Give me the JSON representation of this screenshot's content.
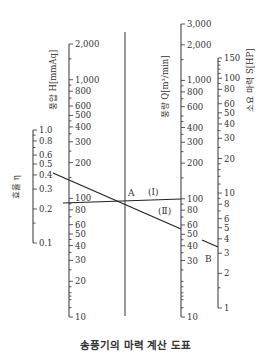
{
  "caption": "송풍기의 마력 계산 도표",
  "chart_data": {
    "type": "nomograph",
    "title": "송풍기의 마력 계산 도표",
    "axes": [
      {
        "id": "efficiency",
        "title": "효율 η",
        "scale": "log",
        "range": [
          0.1,
          1.0
        ],
        "tick_labels": [
          "1.0",
          "0.8",
          "0.6",
          "0.5",
          "0.4",
          "0.3",
          "0.2",
          "0.1"
        ]
      },
      {
        "id": "pressure",
        "title": "풍압 H[mmAq]",
        "scale": "log",
        "range": [
          10,
          2000
        ],
        "tick_labels": [
          "2,000",
          "1,000",
          "800",
          "600",
          "500",
          "400",
          "300",
          "200",
          "100",
          "80",
          "60",
          "50",
          "40",
          "30",
          "20",
          "10"
        ]
      },
      {
        "id": "pivot",
        "title": "",
        "scale": "none",
        "tick_labels": []
      },
      {
        "id": "airflow",
        "title": "풍량 Q[m³/min]",
        "scale": "log",
        "range": [
          10,
          3000
        ],
        "tick_labels": [
          "3,000",
          "2,000",
          "1,000",
          "800",
          "600",
          "400",
          "300",
          "200",
          "100",
          "80",
          "60",
          "50",
          "40",
          "30",
          "10"
        ]
      },
      {
        "id": "power",
        "title": "소요 마력 S[HP]",
        "scale": "log",
        "range": [
          1,
          150
        ],
        "tick_labels": [
          "150",
          "100",
          "80",
          "60",
          "50",
          "40",
          "30",
          "20",
          "10",
          "8",
          "6",
          "5",
          "4",
          "3",
          "2",
          "1"
        ]
      }
    ],
    "annotations": [
      {
        "label": "A",
        "description": "pivot point on reference line"
      },
      {
        "label": "(Ⅰ)",
        "description": "line from H≈90 mmAq through A to Q≈100 m³/min"
      },
      {
        "label": "(Ⅱ)",
        "description": "line from η≈0.4 through A to Q≈55 m³/min"
      },
      {
        "label": "B",
        "description": "result on S axis ≈ 4 HP"
      }
    ],
    "example": {
      "efficiency": 0.4,
      "pressure_mmAq": 90,
      "airflow_m3_per_min": 55,
      "power_HP": 4
    }
  },
  "labels": {
    "eta_title": "효율 η",
    "h_title": "풍압 H[mmAq]",
    "q_title": "풍량 Q[m³/min]",
    "s_title": "소요 마력 S[HP]",
    "point_a": "A",
    "point_b": "B",
    "line_1": "(Ⅰ)",
    "line_2": "(Ⅱ)"
  }
}
